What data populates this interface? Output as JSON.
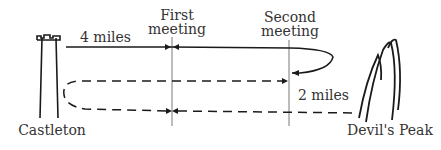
{
  "diagram": {
    "labels": {
      "start_town": "Castleton",
      "end_town": "Devil's Peak",
      "first_meeting_line1": "First",
      "first_meeting_line2": "meeting",
      "second_meeting_line1": "Second",
      "second_meeting_line2": "meeting",
      "first_distance": "4 miles",
      "second_distance": "2 miles"
    },
    "icons": {
      "start": "tower-icon",
      "end": "mountain-peaks-icon"
    },
    "colors": {
      "ink": "#1a1a1a",
      "text": "#333333",
      "guide": "#555555",
      "background": "#ffffff"
    }
  }
}
